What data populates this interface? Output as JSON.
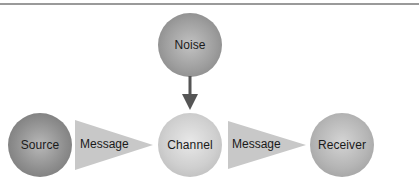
{
  "diagram": {
    "type": "communication-model",
    "nodes": {
      "noise": {
        "label": "Noise"
      },
      "source": {
        "label": "Source"
      },
      "channel": {
        "label": "Channel"
      },
      "receiver": {
        "label": "Receiver"
      }
    },
    "connectors": [
      {
        "from": "source",
        "to": "channel",
        "label": "Message"
      },
      {
        "from": "channel",
        "to": "receiver",
        "label": "Message"
      },
      {
        "from": "noise",
        "to": "channel",
        "label": ""
      }
    ],
    "colors": {
      "rule": "#9a9a9a",
      "arrow": "#555555",
      "wedge": "#c8c8c8",
      "text": "#1a1a1a"
    }
  }
}
